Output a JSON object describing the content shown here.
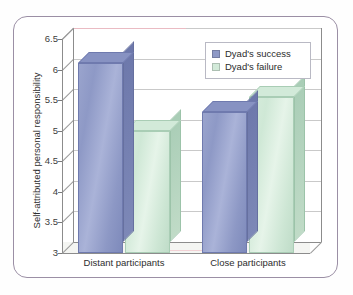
{
  "chart_data": {
    "type": "bar",
    "title": "",
    "subtitle": "",
    "xlabel": "",
    "ylabel": "Self-attributed personal responsibility",
    "categories": [
      "Distant participants",
      "Close participants"
    ],
    "series": [
      {
        "name": "Dyad's success",
        "color": "#8e99c6",
        "values": [
          6.1,
          5.3
        ]
      },
      {
        "name": "Dyad's failure",
        "color": "#d2ead9",
        "values": [
          5.0,
          5.55
        ]
      }
    ],
    "ylim": [
      3,
      6.5
    ],
    "yticks": [
      "6.5",
      "6",
      "5.5",
      "5",
      "4.5",
      "4",
      "3.5",
      "3"
    ],
    "ytick_values": [
      6.5,
      6,
      5.5,
      5,
      4.5,
      4,
      3.5,
      3
    ],
    "grid": true,
    "legend_position": "top-right",
    "style": "3d-bar",
    "frame_color": "#9b8fa5",
    "gridline_color": "#c9c9c9",
    "axis_color": "#8c8c8c"
  },
  "legend": {
    "items": [
      {
        "label": "Dyad's success",
        "swatch": "#8e99c6"
      },
      {
        "label": "Dyad's failure",
        "swatch": "#d2ead9"
      }
    ]
  }
}
